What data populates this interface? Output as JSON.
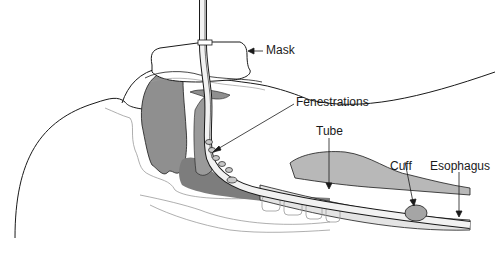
{
  "diagram": {
    "type": "anatomical-illustration",
    "colors": {
      "line": "#1a1a1a",
      "soft_tissue_dark": "#8a8a8a",
      "soft_tissue_mid": "#a8a8a8",
      "soft_tissue_light": "#cfcfcf",
      "outline_light": "#9a9a9a",
      "background": "#ffffff"
    },
    "labels": {
      "mask": "Mask",
      "fenestrations": "Fenestrations",
      "tube": "Tube",
      "cuff": "Cuff",
      "esophagus": "Esophagus"
    }
  }
}
